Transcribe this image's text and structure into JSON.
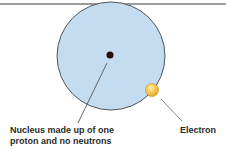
{
  "diagram": {
    "labels": {
      "nucleus_line1": "Nucleus made up of one",
      "nucleus_line2": "proton and no neutrons",
      "electron": "Electron"
    },
    "colors": {
      "atom_fill": "#c4dcef",
      "atom_stroke": "#555555",
      "nucleus": "#2a0a08",
      "electron_fill": "#f5c73a",
      "rule": "#7a7a7a"
    }
  }
}
